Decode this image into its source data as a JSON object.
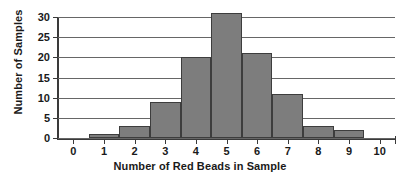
{
  "chart_data": {
    "type": "bar",
    "title": "",
    "xlabel": "Number of Red Beads in Sample",
    "ylabel": "Number of Samples",
    "categories": [
      "0",
      "1",
      "2",
      "3",
      "4",
      "5",
      "6",
      "7",
      "8",
      "9",
      "10"
    ],
    "values": [
      0,
      1,
      3,
      9,
      20,
      31,
      21,
      11,
      3,
      2,
      0
    ],
    "xlim": [
      -0.5,
      10.5
    ],
    "ylim": [
      0,
      32
    ],
    "xticks": [
      "0",
      "1",
      "2",
      "3",
      "4",
      "5",
      "6",
      "7",
      "8",
      "9",
      "10"
    ],
    "yticks": [
      "0",
      "5",
      "10",
      "15",
      "20",
      "25",
      "30"
    ],
    "ytick_values": [
      0,
      5,
      10,
      15,
      20,
      25,
      30
    ],
    "grid": "horizontal",
    "legend": "none",
    "bar_color": "#7d7d7d",
    "bar_edge_color": "#3d3d3d",
    "axis_color": "#3a3a3a",
    "grid_color": "#666666",
    "background": "#ffffff"
  }
}
